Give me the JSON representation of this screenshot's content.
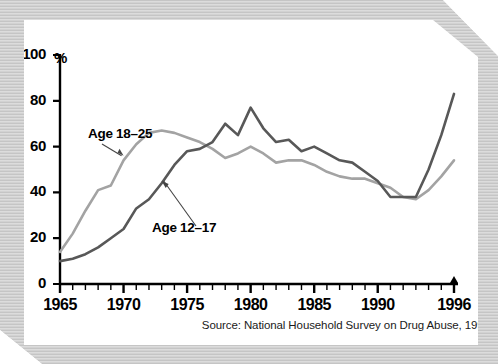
{
  "figure": {
    "y_unit_label": "%",
    "source_note": "Source: National Household Survey on Drug Abuse, 1997",
    "label_age_18_25": "Age 18–25",
    "label_age_12_17": "Age 12–17",
    "colors": {
      "series_18_25": "#a3a3a3",
      "series_12_17": "#585858",
      "axis": "#000000",
      "frame": "#cfcfcf",
      "card": "#ffffff"
    }
  },
  "chart_data": {
    "type": "line",
    "title": "",
    "subtitle": "",
    "xlabel": "",
    "ylabel": "%",
    "xlim": [
      1965,
      1996
    ],
    "ylim": [
      0,
      100
    ],
    "grid": false,
    "legend_position": "inline-annotations",
    "y_ticks": [
      0,
      20,
      40,
      60,
      80,
      100
    ],
    "x_ticks": [
      1965,
      1966,
      1967,
      1968,
      1969,
      1970,
      1971,
      1972,
      1973,
      1974,
      1975,
      1976,
      1977,
      1978,
      1979,
      1980,
      1981,
      1982,
      1983,
      1984,
      1985,
      1986,
      1987,
      1988,
      1989,
      1990,
      1991,
      1992,
      1993,
      1994,
      1995,
      1996
    ],
    "x_tick_labels": [
      "1965",
      "1970",
      "1975",
      "1980",
      "1985",
      "1990",
      "1996"
    ],
    "x_tick_label_years": [
      1965,
      1970,
      1975,
      1980,
      1985,
      1990,
      1996
    ],
    "x": [
      1965,
      1966,
      1967,
      1968,
      1969,
      1970,
      1971,
      1972,
      1973,
      1974,
      1975,
      1976,
      1977,
      1978,
      1979,
      1980,
      1981,
      1982,
      1983,
      1984,
      1985,
      1986,
      1987,
      1988,
      1989,
      1990,
      1991,
      1992,
      1993,
      1994,
      1995,
      1996
    ],
    "series": [
      {
        "name": "Age 18–25",
        "color": "#a3a3a3",
        "values": [
          14,
          22,
          32,
          41,
          43,
          54,
          61,
          66,
          67,
          66,
          64,
          62,
          59,
          55,
          57,
          60,
          57,
          53,
          54,
          54,
          52,
          49,
          47,
          46,
          46,
          44,
          42,
          38,
          37,
          41,
          47,
          54
        ]
      },
      {
        "name": "Age 12–17",
        "color": "#585858",
        "values": [
          10,
          11,
          13,
          16,
          20,
          24,
          33,
          37,
          44,
          52,
          58,
          59,
          62,
          70,
          65,
          77,
          68,
          62,
          63,
          58,
          60,
          57,
          54,
          53,
          49,
          45,
          38,
          38,
          38,
          50,
          65,
          83
        ]
      }
    ],
    "annotations": [
      {
        "text": "Age 18–25",
        "points_to_year": 1970,
        "points_to_value": 56
      },
      {
        "text": "Age 12–17",
        "points_to_year": 1973,
        "points_to_value": 45
      }
    ]
  }
}
